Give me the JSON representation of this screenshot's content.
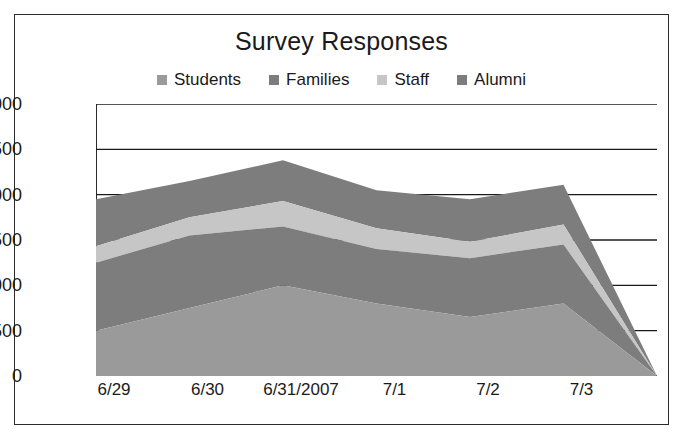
{
  "chart_data": {
    "type": "area",
    "stacked": true,
    "title": "Survey Responses",
    "xlabel": "",
    "ylabel": "",
    "categories": [
      "6/29",
      "6/30",
      "6/31/2007",
      "7/1",
      "7/2",
      "7/3",
      ""
    ],
    "xtick_labels": [
      "6/29",
      "6/30",
      "6/31/2007",
      "7/1",
      "7/2",
      "7/3"
    ],
    "ytick_labels": [
      "0",
      "500",
      "1,000",
      "1,500",
      "2,000",
      "2,500",
      "3,000"
    ],
    "ytick_values": [
      0,
      500,
      1000,
      1500,
      2000,
      2500,
      3000
    ],
    "ylim": [
      0,
      3000
    ],
    "grid": true,
    "grid_axis": "y",
    "legend_position": "top",
    "series": [
      {
        "name": "Students",
        "color": "#9a9a9a",
        "values": [
          500,
          750,
          1000,
          800,
          650,
          800,
          0
        ]
      },
      {
        "name": "Families",
        "color": "#7d7d7d",
        "values": [
          750,
          800,
          650,
          600,
          650,
          650,
          0
        ]
      },
      {
        "name": "Staff",
        "color": "#c6c6c6",
        "values": [
          180,
          200,
          280,
          230,
          180,
          220,
          0
        ]
      },
      {
        "name": "Alumni",
        "color": "#7d7d7d",
        "values": [
          520,
          400,
          450,
          420,
          470,
          440,
          0
        ]
      }
    ],
    "totals": [
      1950,
      2150,
      2380,
      2050,
      1950,
      2110,
      0
    ]
  },
  "legend": {
    "items": [
      {
        "label": "Students",
        "color": "#9a9a9a"
      },
      {
        "label": "Families",
        "color": "#7d7d7d"
      },
      {
        "label": "Staff",
        "color": "#c6c6c6"
      },
      {
        "label": "Alumni",
        "color": "#7d7d7d"
      }
    ]
  },
  "colors": {
    "axis": "#2b2b2b",
    "grid": "#1a1a1a",
    "text": "#1a1a1a",
    "background": "#ffffff",
    "border": "#2b2b2b"
  }
}
